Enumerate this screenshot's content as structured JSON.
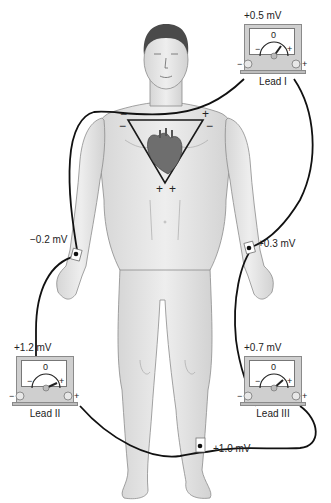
{
  "colors": {
    "skin": "#e4e4e4",
    "skin_outline": "#8c8c8c",
    "wire": "#111111",
    "meter_case": "#cfcfcf",
    "triangle": "#1a1a1a"
  },
  "electrodes": {
    "right_arm": {
      "label": "−0.2 mV"
    },
    "left_arm": {
      "label": "+0.3 mV"
    },
    "left_leg": {
      "label": "+1.0 mV"
    }
  },
  "meters": [
    {
      "name": "Lead I",
      "reading": "+0.5 mV",
      "zero": "0",
      "minus": "−",
      "plus": "+"
    },
    {
      "name": "Lead II",
      "reading": "+1.2 mV",
      "zero": "0",
      "minus": "−",
      "plus": "+"
    },
    {
      "name": "Lead III",
      "reading": "+0.7 mV",
      "zero": "0",
      "minus": "−",
      "plus": "+"
    }
  ],
  "triangle": {
    "top_left_sign": "−",
    "top_right_sign": "+",
    "left_side_sign": "−",
    "right_side_sign": "−",
    "bottom_left_sign": "+",
    "bottom_right_sign": "+"
  },
  "icons": [
    "heart-icon",
    "human-body-figure",
    "galvanometer-icon"
  ]
}
